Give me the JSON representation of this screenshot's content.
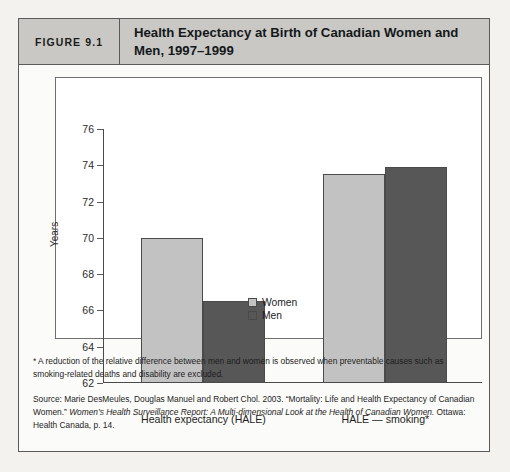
{
  "figure": {
    "number_label": "FIGURE 9.1",
    "title": "Health Expectancy at Birth of Canadian Women and Men, 1997–1999"
  },
  "chart_data": {
    "type": "bar",
    "title": "Health Expectancy at Birth of Canadian Women and Men, 1997–1999",
    "categories": [
      "Health expectancy (HALE)",
      "HALE — smoking*"
    ],
    "series": [
      {
        "name": "Women",
        "values": [
          70.0,
          73.5
        ],
        "color": "#c2c2c2"
      },
      {
        "name": "Men",
        "values": [
          66.5,
          73.9
        ],
        "color": "#575757"
      }
    ],
    "xlabel": "",
    "ylabel": "Years",
    "ylim": [
      62,
      76
    ],
    "yticks": [
      62,
      64,
      66,
      68,
      70,
      72,
      74,
      76
    ],
    "ytick_labels": [
      "62",
      "64",
      "66",
      "68",
      "70",
      "72",
      "74",
      "76"
    ],
    "grid": false,
    "legend_position": "inside-center-bottom"
  },
  "notes": {
    "footnote": "* A reduction of the relative difference between men and women is observed when preventable causes such as smoking-related deaths and disability are excluded.",
    "source_lead": "Source: Marie DesMeules, Douglas Manuel and Robert Chol. 2003. “Mortality: Life and Health Expectancy of Canadian Women.” ",
    "source_italic": "Women’s Health Surveillance Report: A Multi-dimensional Look at the Health of Canadian Women.",
    "source_tail": " Ottawa: Health Canada, p. 14."
  }
}
